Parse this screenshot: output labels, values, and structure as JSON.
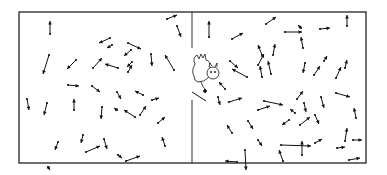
{
  "figure": {
    "container": {
      "x": 19,
      "y": 12,
      "width": 347,
      "height": 151,
      "stroke": "#222222"
    },
    "divider": {
      "x": 192,
      "top": 12,
      "bottom": 163,
      "door_gap": [
        48,
        92
      ]
    },
    "demon": {
      "x": 192,
      "y": 52,
      "label": "demon-figure"
    },
    "left_chamber": {
      "molecules": [
        [
          50,
          34,
          50,
          21
        ],
        [
          49,
          55,
          43,
          74
        ],
        [
          110,
          38,
          99,
          43
        ],
        [
          76,
          60,
          67,
          69
        ],
        [
          93,
          68,
          102,
          58
        ],
        [
          68,
          85,
          79,
          86
        ],
        [
          92,
          86,
          100,
          92
        ],
        [
          27,
          99,
          29,
          110
        ],
        [
          47,
          103,
          44,
          115
        ],
        [
          74,
          110,
          74,
          99
        ],
        [
          102,
          107,
          101,
          119
        ],
        [
          58,
          142,
          55,
          150
        ],
        [
          83,
          135,
          81,
          143
        ],
        [
          86,
          152,
          100,
          146
        ],
        [
          48,
          167,
          50,
          170
        ],
        [
          128,
          43,
          141,
          49
        ],
        [
          112,
          45,
          107,
          48
        ],
        [
          131,
          50,
          124,
          56
        ],
        [
          132,
          62,
          127,
          67
        ],
        [
          167,
          19,
          177,
          15
        ],
        [
          177,
          26,
          181,
          37
        ],
        [
          128,
          72,
          132,
          65
        ],
        [
          118,
          68,
          105,
          64
        ],
        [
          151,
          54,
          152,
          66
        ],
        [
          174,
          70,
          165,
          55
        ],
        [
          117,
          92,
          121,
          99
        ],
        [
          117,
          110,
          114,
          108
        ],
        [
          143,
          95,
          135,
          91
        ],
        [
          140,
          115,
          146,
          106
        ],
        [
          126,
          161,
          140,
          156
        ],
        [
          104,
          139,
          107,
          149
        ],
        [
          152,
          100,
          159,
          98
        ],
        [
          135,
          117,
          124,
          110
        ],
        [
          158,
          123,
          165,
          117
        ],
        [
          165,
          146,
          162,
          137
        ],
        [
          118,
          155,
          122,
          158
        ]
      ]
    },
    "right_chamber": {
      "molecules": [
        [
          209,
          37,
          209,
          21
        ],
        [
          232,
          39,
          243,
          33
        ],
        [
          266,
          24,
          276,
          17
        ],
        [
          262,
          55,
          258,
          45
        ],
        [
          230,
          61,
          238,
          68
        ],
        [
          262,
          77,
          260,
          66
        ],
        [
          247,
          77,
          232,
          69
        ],
        [
          258,
          65,
          264,
          54
        ],
        [
          271,
          74,
          268,
          61
        ],
        [
          273,
          55,
          275,
          44
        ],
        [
          225,
          89,
          219,
          82
        ],
        [
          218,
          97,
          220,
          105
        ],
        [
          229,
          102,
          242,
          98
        ],
        [
          232,
          133,
          227,
          125
        ],
        [
          248,
          121,
          253,
          129
        ],
        [
          258,
          110,
          270,
          106
        ],
        [
          264,
          101,
          283,
          105
        ],
        [
          301,
          28,
          298,
          25
        ],
        [
          285,
          32,
          302,
          32
        ],
        [
          303,
          48,
          301,
          37
        ],
        [
          320,
          29,
          330,
          28
        ],
        [
          347,
          26,
          347,
          15
        ],
        [
          305,
          63,
          303,
          73
        ],
        [
          324,
          61,
          327,
          56
        ],
        [
          336,
          78,
          341,
          67
        ],
        [
          314,
          75,
          320,
          66
        ],
        [
          345,
          68,
          347,
          60
        ],
        [
          297,
          99,
          303,
          91
        ],
        [
          304,
          103,
          306,
          112
        ],
        [
          321,
          97,
          324,
          108
        ],
        [
          295,
          113,
          290,
          109
        ],
        [
          336,
          93,
          350,
          97
        ],
        [
          315,
          115,
          319,
          124
        ],
        [
          356,
          118,
          354,
          108
        ],
        [
          281,
          145,
          311,
          146
        ],
        [
          345,
          141,
          347,
          128
        ],
        [
          353,
          140,
          362,
          140
        ],
        [
          349,
          160,
          360,
          158
        ],
        [
          302,
          155,
          302,
          141
        ],
        [
          283,
          161,
          279,
          150
        ],
        [
          237,
          162,
          225,
          161
        ],
        [
          245,
          150,
          246,
          170
        ],
        [
          337,
          148,
          345,
          147
        ],
        [
          315,
          143,
          322,
          139
        ],
        [
          300,
          125,
          310,
          117
        ],
        [
          289,
          120,
          282,
          125
        ],
        [
          258,
          140,
          262,
          146
        ]
      ]
    }
  }
}
